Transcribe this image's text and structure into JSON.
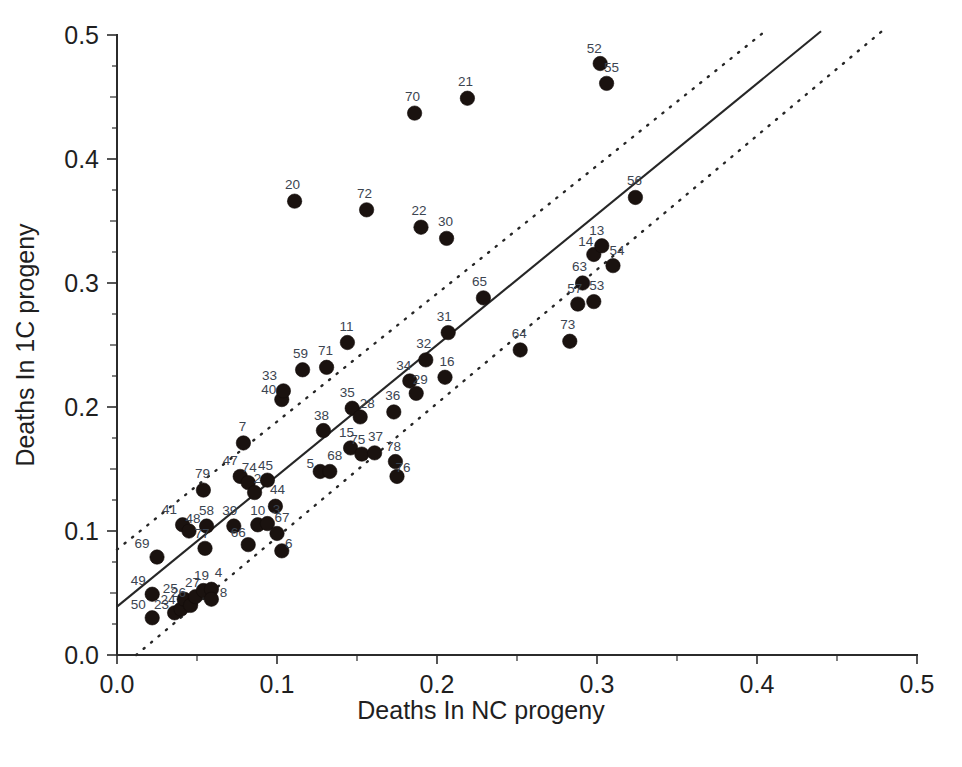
{
  "chart_data": {
    "type": "scatter",
    "title": "",
    "xlabel": "Deaths In NC progeny",
    "ylabel": "Deaths In 1C progeny",
    "xlim": [
      0.0,
      0.5
    ],
    "ylim": [
      0.0,
      0.5
    ],
    "xticks": [
      "0.0",
      "0.1",
      "0.2",
      "0.3",
      "0.4",
      "0.5"
    ],
    "yticks": [
      "0.0",
      "0.1",
      "0.2",
      "0.3",
      "0.4",
      "0.5"
    ],
    "xtick_values": [
      0.0,
      0.1,
      0.2,
      0.3,
      0.4,
      0.5
    ],
    "ytick_values": [
      0.0,
      0.1,
      0.2,
      0.3,
      0.4,
      0.5
    ],
    "grid": false,
    "legend": "none",
    "point_marker": "filled-circle",
    "point_color": "#1a120f",
    "label_color": "#3b4450",
    "line_color": "#262626",
    "fit_line": {
      "style": "solid",
      "x": [
        0.0,
        0.44
      ],
      "y": [
        0.039,
        0.503
      ],
      "slope": 1.055,
      "intercept": 0.039
    },
    "confidence_bands": [
      {
        "name": "upper-band",
        "style": "dotted",
        "x": [
          0.0,
          0.405
        ],
        "y": [
          0.085,
          0.503
        ]
      },
      {
        "name": "lower-band",
        "style": "dotted",
        "x": [
          0.012,
          0.478
        ],
        "y": [
          0.0,
          0.503
        ]
      }
    ],
    "points": [
      {
        "label": "50",
        "x": 0.022,
        "y": 0.03,
        "lx": -14,
        "ly": -9
      },
      {
        "label": "49",
        "x": 0.022,
        "y": 0.049,
        "lx": -14,
        "ly": -9
      },
      {
        "label": "69",
        "x": 0.025,
        "y": 0.079,
        "lx": -15,
        "ly": -9
      },
      {
        "label": "23",
        "x": 0.036,
        "y": 0.034,
        "lx": -13,
        "ly": -4
      },
      {
        "label": "24",
        "x": 0.04,
        "y": 0.037,
        "lx": -13,
        "ly": -5
      },
      {
        "label": "25",
        "x": 0.042,
        "y": 0.045,
        "lx": -14,
        "ly": -6
      },
      {
        "label": "26",
        "x": 0.046,
        "y": 0.04,
        "lx": -12,
        "ly": -8
      },
      {
        "label": "27",
        "x": 0.049,
        "y": 0.047,
        "lx": -3,
        "ly": -10
      },
      {
        "label": "41",
        "x": 0.041,
        "y": 0.105,
        "lx": -13,
        "ly": -11
      },
      {
        "label": "48",
        "x": 0.045,
        "y": 0.1,
        "lx": 4,
        "ly": -8
      },
      {
        "label": "19",
        "x": 0.054,
        "y": 0.052,
        "lx": -2,
        "ly": -11
      },
      {
        "label": "4",
        "x": 0.059,
        "y": 0.053,
        "lx": 7,
        "ly": -12
      },
      {
        "label": "8",
        "x": 0.059,
        "y": 0.045,
        "lx": 12,
        "ly": -2
      },
      {
        "label": "58",
        "x": 0.056,
        "y": 0.104,
        "lx": 0,
        "ly": -11
      },
      {
        "label": "79",
        "x": 0.054,
        "y": 0.133,
        "lx": -1,
        "ly": -12
      },
      {
        "label": "77",
        "x": 0.055,
        "y": 0.086,
        "lx": -3,
        "ly": -10
      },
      {
        "label": "39",
        "x": 0.073,
        "y": 0.104,
        "lx": -4,
        "ly": -11
      },
      {
        "label": "66",
        "x": 0.082,
        "y": 0.089,
        "lx": -10,
        "ly": -8
      },
      {
        "label": "47",
        "x": 0.077,
        "y": 0.144,
        "lx": -10,
        "ly": -11
      },
      {
        "label": "74",
        "x": 0.082,
        "y": 0.139,
        "lx": 1,
        "ly": -11
      },
      {
        "label": "7",
        "x": 0.079,
        "y": 0.171,
        "lx": -1,
        "ly": -12
      },
      {
        "label": "2",
        "x": 0.086,
        "y": 0.131,
        "lx": 3,
        "ly": -10
      },
      {
        "label": "10",
        "x": 0.088,
        "y": 0.105,
        "lx": 0,
        "ly": -10
      },
      {
        "label": "3",
        "x": 0.094,
        "y": 0.106,
        "lx": 9,
        "ly": -10
      },
      {
        "label": "45",
        "x": 0.094,
        "y": 0.141,
        "lx": -2,
        "ly": -10
      },
      {
        "label": "44",
        "x": 0.099,
        "y": 0.12,
        "lx": 2,
        "ly": -12
      },
      {
        "label": "67",
        "x": 0.1,
        "y": 0.098,
        "lx": 5,
        "ly": -11
      },
      {
        "label": "6",
        "x": 0.103,
        "y": 0.084,
        "lx": 7,
        "ly": -3
      },
      {
        "label": "40",
        "x": 0.103,
        "y": 0.206,
        "lx": -13,
        "ly": -6
      },
      {
        "label": "33",
        "x": 0.104,
        "y": 0.213,
        "lx": -14,
        "ly": -11
      },
      {
        "label": "20",
        "x": 0.111,
        "y": 0.366,
        "lx": -2,
        "ly": -12
      },
      {
        "label": "59",
        "x": 0.116,
        "y": 0.23,
        "lx": -2,
        "ly": -12
      },
      {
        "label": "5",
        "x": 0.127,
        "y": 0.148,
        "lx": -10,
        "ly": -3
      },
      {
        "label": "68",
        "x": 0.133,
        "y": 0.148,
        "lx": 5,
        "ly": -11
      },
      {
        "label": "38",
        "x": 0.129,
        "y": 0.181,
        "lx": -2,
        "ly": -11
      },
      {
        "label": "71",
        "x": 0.131,
        "y": 0.232,
        "lx": -1,
        "ly": -12
      },
      {
        "label": "11",
        "x": 0.144,
        "y": 0.252,
        "lx": -1,
        "ly": -12
      },
      {
        "label": "15",
        "x": 0.146,
        "y": 0.167,
        "lx": -4,
        "ly": -11
      },
      {
        "label": "35",
        "x": 0.147,
        "y": 0.199,
        "lx": -5,
        "ly": -11
      },
      {
        "label": "28",
        "x": 0.152,
        "y": 0.192,
        "lx": 7,
        "ly": -9
      },
      {
        "label": "75",
        "x": 0.153,
        "y": 0.162,
        "lx": -4,
        "ly": -10
      },
      {
        "label": "37",
        "x": 0.161,
        "y": 0.163,
        "lx": 1,
        "ly": -12
      },
      {
        "label": "72",
        "x": 0.156,
        "y": 0.359,
        "lx": -2,
        "ly": -12
      },
      {
        "label": "36",
        "x": 0.173,
        "y": 0.196,
        "lx": -1,
        "ly": -12
      },
      {
        "label": "78",
        "x": 0.174,
        "y": 0.156,
        "lx": -2,
        "ly": -11
      },
      {
        "label": "76",
        "x": 0.175,
        "y": 0.144,
        "lx": 6,
        "ly": -4
      },
      {
        "label": "34",
        "x": 0.183,
        "y": 0.221,
        "lx": -6,
        "ly": -11
      },
      {
        "label": "29",
        "x": 0.187,
        "y": 0.211,
        "lx": 4,
        "ly": -9
      },
      {
        "label": "22",
        "x": 0.19,
        "y": 0.345,
        "lx": -2,
        "ly": -12
      },
      {
        "label": "70",
        "x": 0.186,
        "y": 0.437,
        "lx": -2,
        "ly": -12
      },
      {
        "label": "32",
        "x": 0.193,
        "y": 0.238,
        "lx": -2,
        "ly": -12
      },
      {
        "label": "16",
        "x": 0.205,
        "y": 0.224,
        "lx": 2,
        "ly": -11
      },
      {
        "label": "30",
        "x": 0.206,
        "y": 0.336,
        "lx": -1,
        "ly": -12
      },
      {
        "label": "31",
        "x": 0.207,
        "y": 0.26,
        "lx": -4,
        "ly": -12
      },
      {
        "label": "21",
        "x": 0.219,
        "y": 0.449,
        "lx": -2,
        "ly": -12
      },
      {
        "label": "65",
        "x": 0.229,
        "y": 0.288,
        "lx": -4,
        "ly": -12
      },
      {
        "label": "64",
        "x": 0.252,
        "y": 0.246,
        "lx": -1,
        "ly": -12
      },
      {
        "label": "73",
        "x": 0.283,
        "y": 0.253,
        "lx": -2,
        "ly": -12
      },
      {
        "label": "57",
        "x": 0.288,
        "y": 0.283,
        "lx": -3,
        "ly": -11
      },
      {
        "label": "53",
        "x": 0.298,
        "y": 0.285,
        "lx": 3,
        "ly": -12
      },
      {
        "label": "63",
        "x": 0.291,
        "y": 0.3,
        "lx": -3,
        "ly": -12
      },
      {
        "label": "14",
        "x": 0.298,
        "y": 0.323,
        "lx": -8,
        "ly": -8
      },
      {
        "label": "13",
        "x": 0.303,
        "y": 0.33,
        "lx": -5,
        "ly": -11
      },
      {
        "label": "52",
        "x": 0.302,
        "y": 0.477,
        "lx": -6,
        "ly": -11
      },
      {
        "label": "55",
        "x": 0.306,
        "y": 0.461,
        "lx": 5,
        "ly": -11
      },
      {
        "label": "54",
        "x": 0.31,
        "y": 0.314,
        "lx": 4,
        "ly": -11
      },
      {
        "label": "56",
        "x": 0.324,
        "y": 0.369,
        "lx": -1,
        "ly": -12
      }
    ]
  }
}
